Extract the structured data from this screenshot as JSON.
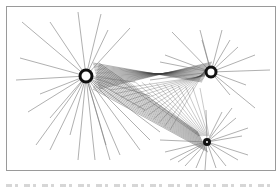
{
  "figure": {
    "type": "network-diagram",
    "frame": {
      "x": 6,
      "y": 6,
      "width": 270,
      "height": 165,
      "stroke": "#9a9a9a"
    },
    "colors": {
      "spoke": "#7a7a7a",
      "link": "#3a3a3a",
      "hub_stroke": "#111111",
      "hub_fill": "#ffffff"
    },
    "hubs": [
      {
        "id": "hub-large",
        "cx": 86,
        "cy": 76,
        "r": 6,
        "stroke_width": 3,
        "spokes": [
          [
            22,
            22
          ],
          [
            50,
            22
          ],
          [
            78,
            12
          ],
          [
            101,
            14
          ],
          [
            108,
            30
          ],
          [
            130,
            28
          ],
          [
            20,
            58
          ],
          [
            16,
            80
          ],
          [
            40,
            94
          ],
          [
            28,
            112
          ],
          [
            50,
            118
          ],
          [
            36,
            145
          ],
          [
            50,
            150
          ],
          [
            70,
            135
          ],
          [
            78,
            160
          ],
          [
            95,
            160
          ],
          [
            106,
            145
          ],
          [
            110,
            160
          ],
          [
            120,
            155
          ],
          [
            140,
            150
          ],
          [
            150,
            140
          ],
          [
            160,
            132
          ],
          [
            145,
            110
          ],
          [
            150,
            96
          ],
          [
            135,
            82
          ]
        ]
      },
      {
        "id": "hub-right",
        "cx": 211,
        "cy": 72,
        "r": 5,
        "stroke_width": 3,
        "spokes": [
          [
            172,
            32
          ],
          [
            200,
            30
          ],
          [
            202,
            40
          ],
          [
            222,
            30
          ],
          [
            238,
            47
          ],
          [
            255,
            55
          ],
          [
            270,
            70
          ],
          [
            246,
            85
          ],
          [
            230,
            40
          ],
          [
            165,
            55
          ],
          [
            160,
            62
          ],
          [
            150,
            80
          ],
          [
            230,
            95
          ],
          [
            255,
            108
          ]
        ]
      },
      {
        "id": "hub-bottom",
        "cx": 207,
        "cy": 142,
        "r": 2.5,
        "stroke_width": 3,
        "spokes": [
          [
            160,
            140
          ],
          [
            165,
            152
          ],
          [
            170,
            160
          ],
          [
            178,
            162
          ],
          [
            185,
            166
          ],
          [
            196,
            168
          ],
          [
            205,
            170
          ],
          [
            216,
            168
          ],
          [
            226,
            166
          ],
          [
            238,
            160
          ],
          [
            248,
            155
          ],
          [
            242,
            136
          ],
          [
            248,
            128
          ],
          [
            236,
            118
          ],
          [
            222,
            112
          ],
          [
            232,
            108
          ],
          [
            206,
            110
          ]
        ]
      }
    ],
    "links": {
      "from": "hub-large",
      "to": [
        "hub-right",
        "hub-bottom"
      ],
      "fan_count": 18
    },
    "caption": {
      "visible": false,
      "note_visible_text": ""
    }
  }
}
